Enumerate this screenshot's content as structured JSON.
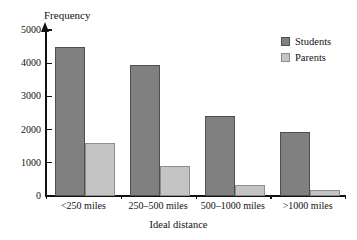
{
  "chart_data": {
    "type": "bar",
    "title": "",
    "xlabel": "Ideal distance",
    "ylabel": "Frequency",
    "categories": [
      "<250 miles",
      "250–500 miles",
      "500–1000 miles",
      ">1000 miles"
    ],
    "series": [
      {
        "name": "Students",
        "color": "#808080",
        "values": [
          4480,
          3960,
          2420,
          1920
        ]
      },
      {
        "name": "Parents",
        "color": "#c4c4c4",
        "values": [
          1600,
          900,
          340,
          180
        ]
      }
    ],
    "ylim": [
      0,
      5000
    ],
    "yticks": [
      0,
      1000,
      2000,
      3000,
      4000,
      5000
    ],
    "ytick_labels": [
      "0",
      "1000",
      "2000",
      "3000",
      "4000",
      "5000"
    ],
    "grid": false,
    "legend_position": "top-right",
    "axis_color": "#111111",
    "background": "#ffffff"
  }
}
